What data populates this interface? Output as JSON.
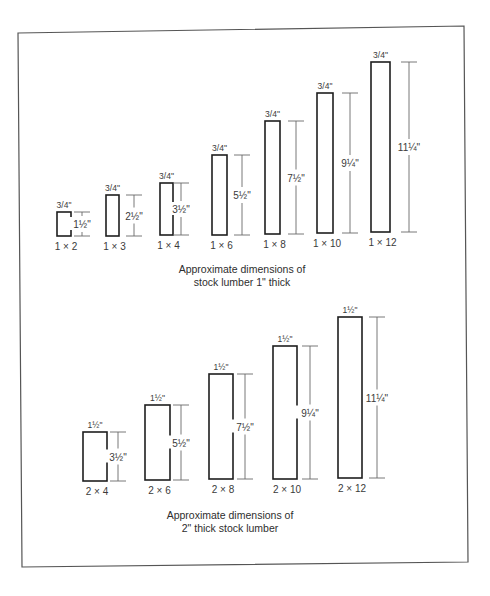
{
  "figure": {
    "colors": {
      "outline": "#1e1e1e",
      "dimension_line": "#6a6a6a",
      "text": "#3a3a3a",
      "frame": "#555555"
    },
    "frame": {
      "corners": [
        [
          18,
          33
        ],
        [
          464,
          26
        ],
        [
          468,
          562
        ],
        [
          22,
          567
        ]
      ]
    },
    "sections": [
      {
        "id": "one-inch",
        "caption_line1": "Approximate dimensions of",
        "caption_line2": "stock lumber 1\" thick",
        "caption_x": 242,
        "caption_y1": 273,
        "caption_y2": 286,
        "boards": [
          {
            "name": "1 × 2",
            "width_label": "3/4\"",
            "height_label": "1½\"",
            "x": 57,
            "y": 212,
            "w": 14,
            "h": 24,
            "dim_x": 82
          },
          {
            "name": "1 × 3",
            "width_label": "3/4\"",
            "height_label": "2½\"",
            "x": 106,
            "y": 195,
            "w": 13,
            "h": 41,
            "dim_x": 134
          },
          {
            "name": "1 × 4",
            "width_label": "3/4\"",
            "height_label": "3½\"",
            "x": 160,
            "y": 183,
            "w": 13,
            "h": 52,
            "dim_x": 181
          },
          {
            "name": "1 × 6",
            "width_label": "3/4\"",
            "height_label": "5½\"",
            "x": 212,
            "y": 155,
            "w": 15,
            "h": 80,
            "dim_x": 242
          },
          {
            "name": "1 × 8",
            "width_label": "3/4\"",
            "height_label": "7½\"",
            "x": 265,
            "y": 121,
            "w": 15,
            "h": 113,
            "dim_x": 296
          },
          {
            "name": "1 × 10",
            "width_label": "3/4\"",
            "height_label": "9¼\"",
            "x": 317,
            "y": 93,
            "w": 16,
            "h": 140,
            "dim_x": 350
          },
          {
            "name": "1 × 12",
            "width_label": "3/4\"",
            "height_label": "11¼\"",
            "x": 371,
            "y": 62,
            "w": 19,
            "h": 170,
            "dim_x": 409
          }
        ]
      },
      {
        "id": "two-inch",
        "caption_line1": "Approximate dimensions of",
        "caption_line2": "2\" thick stock lumber",
        "caption_x": 230,
        "caption_y1": 519,
        "caption_y2": 532,
        "boards": [
          {
            "name": "2 × 4",
            "width_label": "1½\"",
            "height_label": "3½\"",
            "x": 83,
            "y": 432,
            "w": 24,
            "h": 49,
            "dim_x": 118
          },
          {
            "name": "2 × 6",
            "width_label": "1½\"",
            "height_label": "5½\"",
            "x": 145,
            "y": 405,
            "w": 25,
            "h": 75,
            "dim_x": 181
          },
          {
            "name": "2 × 8",
            "width_label": "1½\"",
            "height_label": "7½\"",
            "x": 209,
            "y": 374,
            "w": 24,
            "h": 105,
            "dim_x": 245
          },
          {
            "name": "2 × 10",
            "width_label": "1½\"",
            "height_label": "9¼\"",
            "x": 273,
            "y": 346,
            "w": 24,
            "h": 133,
            "dim_x": 310
          },
          {
            "name": "2 × 12",
            "width_label": "1½\"",
            "height_label": "11¼\"",
            "x": 338,
            "y": 317,
            "w": 24,
            "h": 161,
            "dim_x": 377
          }
        ]
      }
    ]
  }
}
